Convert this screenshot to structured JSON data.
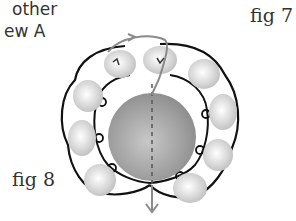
{
  "caption": {
    "line1": "other",
    "line2": "ew A"
  },
  "figures": {
    "fig7_label": "fig 7",
    "fig8_label": "fig 8"
  },
  "diagram": {
    "center_bead_color": "#9a9a9a",
    "small_bead_color": "#d8d8d8",
    "thread_color": "#111111",
    "guide_thread_color": "#8a8a8a",
    "small_bead_count": 9
  }
}
